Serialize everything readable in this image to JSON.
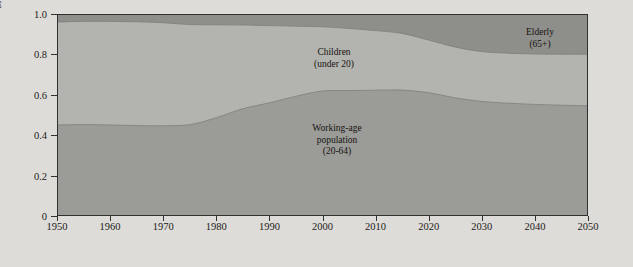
{
  "figure": {
    "background_color": "#dedcd8",
    "frame_color": "#30302e"
  },
  "annotations": [
    {
      "name": "children-label",
      "line1": "Children",
      "line2": "(under 20)",
      "x": 334,
      "y": 47
    },
    {
      "name": "working-age-label",
      "line1": "Working-age",
      "line2": "population",
      "line3": "(20-64)",
      "x": 337,
      "y": 123
    },
    {
      "name": "elderly-label",
      "line1": "Elderly",
      "line2": "(65+)",
      "x": 540,
      "y": 27
    }
  ],
  "chart_data": {
    "type": "area",
    "stacked": true,
    "title": "",
    "xlabel": "",
    "ylabel": "Share of total population",
    "xlim": [
      1950,
      2050
    ],
    "ylim": [
      0,
      1.0
    ],
    "grid": false,
    "legend_position": "inline-annotations",
    "xticks": [
      1950,
      1960,
      1970,
      1980,
      1990,
      2000,
      2010,
      2020,
      2030,
      2040,
      2050
    ],
    "xtick_labels": [
      "1950",
      "1960",
      "1970",
      "1980",
      "1990",
      "2000",
      "2010",
      "2020",
      "2030",
      "2040",
      "2050"
    ],
    "yticks": [
      0,
      0.2,
      0.4,
      0.6,
      0.8,
      1.0
    ],
    "ytick_labels": [
      "0",
      "0.2",
      "0.4",
      "0.6",
      "0.8",
      "1.0"
    ],
    "x": [
      1950,
      1955,
      1960,
      1965,
      1970,
      1975,
      1980,
      1985,
      1990,
      1995,
      2000,
      2005,
      2010,
      2015,
      2020,
      2025,
      2030,
      2035,
      2040,
      2045,
      2050
    ],
    "series": [
      {
        "name": "Working-age population (20-64)",
        "color": "#9b9b98",
        "values": [
          0.45,
          0.452,
          0.45,
          0.447,
          0.446,
          0.452,
          0.487,
          0.532,
          0.561,
          0.594,
          0.62,
          0.622,
          0.624,
          0.625,
          0.612,
          0.586,
          0.568,
          0.559,
          0.553,
          0.549,
          0.546
        ]
      },
      {
        "name": "Children (under 20)",
        "color": "#b3b3b0",
        "values": [
          0.515,
          0.516,
          0.518,
          0.519,
          0.515,
          0.5,
          0.464,
          0.418,
          0.386,
          0.35,
          0.321,
          0.311,
          0.298,
          0.283,
          0.263,
          0.254,
          0.249,
          0.25,
          0.252,
          0.255,
          0.258
        ]
      },
      {
        "name": "Elderly (65+)",
        "color": "#8e8e8b",
        "values": [
          0.035,
          0.032,
          0.032,
          0.034,
          0.039,
          0.048,
          0.049,
          0.05,
          0.053,
          0.056,
          0.059,
          0.067,
          0.078,
          0.092,
          0.125,
          0.16,
          0.183,
          0.191,
          0.195,
          0.196,
          0.196
        ]
      }
    ],
    "cumulative_upper_working_age": [
      0.45,
      0.452,
      0.45,
      0.447,
      0.446,
      0.452,
      0.487,
      0.532,
      0.561,
      0.594,
      0.62,
      0.622,
      0.624,
      0.625,
      0.612,
      0.586,
      0.568,
      0.559,
      0.553,
      0.549,
      0.546
    ],
    "cumulative_upper_children": [
      0.965,
      0.968,
      0.968,
      0.966,
      0.961,
      0.952,
      0.951,
      0.95,
      0.947,
      0.944,
      0.941,
      0.933,
      0.922,
      0.908,
      0.875,
      0.84,
      0.817,
      0.809,
      0.805,
      0.804,
      0.804
    ]
  }
}
